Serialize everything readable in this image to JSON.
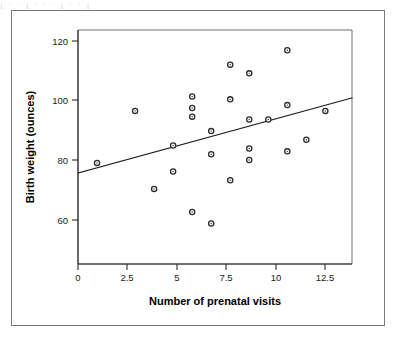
{
  "figure": {
    "border_color": "#7a7a7a",
    "background": "#ffffff",
    "bleed_text": "¡  ·   ·    ¡    ·   ·     ·   ¡    ·    ·   ¡"
  },
  "chart_data": {
    "type": "scatter",
    "title": "",
    "xlabel": "Number of prenatal visits",
    "ylabel": "Birth weight (ounces)",
    "xlim": [
      0,
      14.4
    ],
    "ylim": [
      45,
      126
    ],
    "grid": false,
    "legend": null,
    "xticks": [
      0,
      2.5,
      5,
      7.5,
      10,
      12.5
    ],
    "xticklabels": [
      "0",
      "2.5",
      "5",
      "7.5",
      "10",
      "12.5"
    ],
    "yticks": [
      60,
      80,
      100,
      120
    ],
    "yticklabels": [
      "60",
      "80",
      "100",
      "120"
    ],
    "marker": {
      "shape": "circle-open",
      "edge_color": "#2b2b2b",
      "face_color": "#ffffff",
      "radius": 2.6
    },
    "x": [
      1,
      3,
      4,
      5,
      5,
      6,
      6,
      6,
      6,
      7,
      7,
      7,
      8,
      8,
      8,
      9,
      9,
      9,
      9,
      10,
      11,
      11,
      11,
      12,
      13
    ],
    "y": [
      80,
      98,
      71,
      86,
      77,
      103,
      99,
      96,
      63,
      91,
      83,
      59,
      114,
      102,
      74,
      111,
      95,
      85,
      81,
      95,
      119,
      100,
      84,
      88,
      98
    ],
    "points": [
      {
        "x": 1,
        "y": 80
      },
      {
        "x": 3,
        "y": 98
      },
      {
        "x": 4,
        "y": 71
      },
      {
        "x": 5,
        "y": 86
      },
      {
        "x": 5,
        "y": 77
      },
      {
        "x": 6,
        "y": 103
      },
      {
        "x": 6,
        "y": 99
      },
      {
        "x": 6,
        "y": 96
      },
      {
        "x": 6,
        "y": 63
      },
      {
        "x": 7,
        "y": 91
      },
      {
        "x": 7,
        "y": 83
      },
      {
        "x": 7,
        "y": 59
      },
      {
        "x": 8,
        "y": 114
      },
      {
        "x": 8,
        "y": 102
      },
      {
        "x": 8,
        "y": 74
      },
      {
        "x": 9,
        "y": 111
      },
      {
        "x": 9,
        "y": 95
      },
      {
        "x": 9,
        "y": 85
      },
      {
        "x": 9,
        "y": 81
      },
      {
        "x": 10,
        "y": 95
      },
      {
        "x": 11,
        "y": 119
      },
      {
        "x": 11,
        "y": 100
      },
      {
        "x": 11,
        "y": 84
      },
      {
        "x": 12,
        "y": 88
      },
      {
        "x": 13,
        "y": 98
      }
    ],
    "fit_line": {
      "name": "regression-line",
      "color": "#1a1a1a",
      "width": 1.2,
      "x0": 0,
      "y0": 76.5,
      "x1": 14.4,
      "y1": 102.5,
      "intercept": 76.5,
      "slope": 1.806
    }
  }
}
